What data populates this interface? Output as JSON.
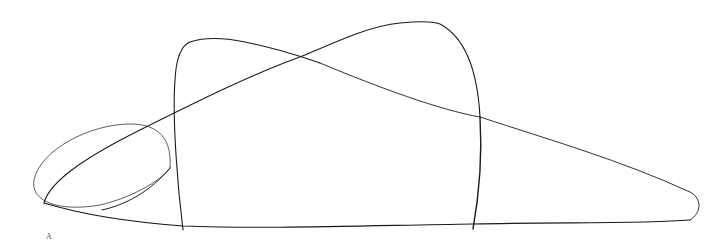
{
  "figure": {
    "label": "A",
    "stroke_color": "#1a1a1a",
    "background": "#ffffff"
  }
}
